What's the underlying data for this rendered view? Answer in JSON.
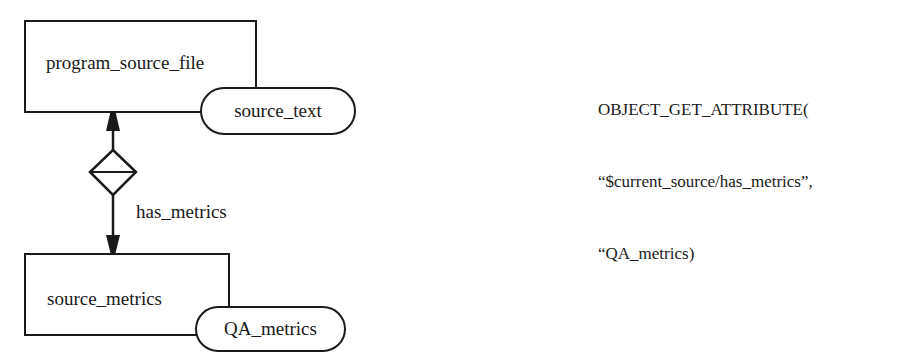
{
  "diagram": {
    "entities": [
      {
        "id": "program_source_file",
        "label": "program_source_file"
      },
      {
        "id": "source_metrics",
        "label": "source_metrics"
      }
    ],
    "attributes": [
      {
        "entity": "program_source_file",
        "label": "source_text"
      },
      {
        "entity": "source_metrics",
        "label": "QA_metrics"
      }
    ],
    "relationship": {
      "label": "has_metrics",
      "from": "program_source_file",
      "to": "source_metrics",
      "symbol": "diamond-with-bar"
    },
    "code": {
      "line1": "OBJECT_GET_ATTRIBUTE(",
      "line2": "“$current_source/has_metrics”,",
      "line3": "“QA_metrics)"
    }
  }
}
